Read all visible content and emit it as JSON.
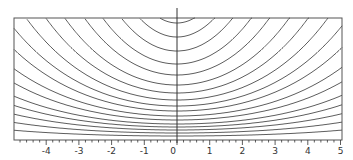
{
  "chart_data": {
    "type": "line",
    "title": "",
    "xlabel": "",
    "ylabel": "",
    "xlim": [
      -4.9,
      5
    ],
    "x_ticks": [
      -4,
      -3,
      -2,
      -1,
      0,
      1,
      2,
      3,
      4,
      5
    ],
    "x_tick_labels": [
      "-4",
      "-3",
      "-2",
      "-1",
      "0",
      "1",
      "2",
      "3",
      "4",
      "5"
    ],
    "grid": false,
    "legend": null,
    "series": [
      {
        "name": "curve-1",
        "center_depth": 4
      },
      {
        "name": "curve-2",
        "center_depth": 7
      },
      {
        "name": "curve-3",
        "center_depth": 10
      },
      {
        "name": "curve-4",
        "center_depth": 13
      },
      {
        "name": "curve-5",
        "center_depth": 16
      },
      {
        "name": "curve-6",
        "center_depth": 20
      },
      {
        "name": "curve-7",
        "center_depth": 24
      },
      {
        "name": "curve-8",
        "center_depth": 29
      },
      {
        "name": "curve-9",
        "center_depth": 34
      },
      {
        "name": "curve-10",
        "center_depth": 40
      },
      {
        "name": "curve-11",
        "center_depth": 47
      },
      {
        "name": "curve-12",
        "center_depth": 55
      },
      {
        "name": "curve-13",
        "center_depth": 65
      },
      {
        "name": "curve-14",
        "center_depth": 76
      },
      {
        "name": "curve-15",
        "center_depth": 89
      },
      {
        "name": "curve-16",
        "center_depth": 103
      },
      {
        "name": "curve-17",
        "center_depth": 117
      }
    ]
  },
  "colors": {
    "line": "#333333",
    "frame": "#555555",
    "background": "#ffffff"
  }
}
